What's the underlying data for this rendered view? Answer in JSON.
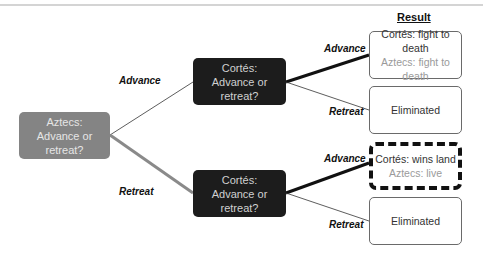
{
  "diagram": {
    "result_header": "Result",
    "root": {
      "lines": [
        "Aztecs:",
        "Advance or",
        "retreat?"
      ],
      "color": "#848484"
    },
    "decision_nodes": [
      {
        "lines": [
          "Cortés:",
          "Advance or",
          "retreat?"
        ],
        "color": "#1c1c1c"
      },
      {
        "lines": [
          "Cortés:",
          "Advance or",
          "retreat?"
        ],
        "color": "#1c1c1c"
      }
    ],
    "root_edges": [
      {
        "label": "Advance",
        "to": "decision_nodes.0",
        "emphasis": "thin",
        "color": "#333333"
      },
      {
        "label": "Retreat",
        "to": "decision_nodes.1",
        "emphasis": "thick",
        "color": "#8a8a8a"
      }
    ],
    "leaf_edges": [
      {
        "label": "Advance",
        "from": "decision_nodes.0",
        "to": "results.0",
        "emphasis": "thick"
      },
      {
        "label": "Retreat",
        "from": "decision_nodes.0",
        "to": "results.1",
        "emphasis": "thin"
      },
      {
        "label": "Advance",
        "from": "decision_nodes.1",
        "to": "results.2",
        "emphasis": "thick"
      },
      {
        "label": "Retreat",
        "from": "decision_nodes.1",
        "to": "results.3",
        "emphasis": "thin"
      }
    ],
    "results": [
      {
        "line1": "Cortés: fight to death",
        "line2": "Aztecs: fight to death",
        "highlighted": false
      },
      {
        "line1": "Eliminated",
        "line2": "",
        "highlighted": false
      },
      {
        "line1": "Cortés: wins land",
        "line2": "Aztecs: live",
        "highlighted": true
      },
      {
        "line1": "Eliminated",
        "line2": "",
        "highlighted": false
      }
    ]
  }
}
